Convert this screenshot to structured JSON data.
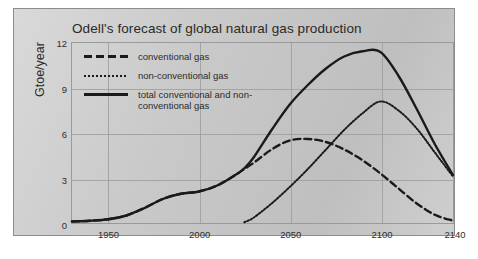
{
  "chart_data": {
    "type": "line",
    "title": "Odell's forecast of global natural gas production",
    "xlabel": "",
    "ylabel": "Gtoe/year",
    "xlim": [
      1930,
      2140
    ],
    "ylim": [
      0,
      12
    ],
    "xticks": [
      "1950",
      "2000",
      "2050",
      "2100",
      "2140"
    ],
    "xtick_values": [
      1950,
      2000,
      2050,
      2100,
      2140
    ],
    "yticks": [
      "0",
      "3",
      "6",
      "9",
      "12"
    ],
    "ytick_values": [
      0,
      3,
      6,
      9,
      12
    ],
    "grid": true,
    "legend_position": "top-left",
    "x": [
      1930,
      1940,
      1950,
      1960,
      1970,
      1980,
      1990,
      2000,
      2010,
      2020,
      2025,
      2030,
      2040,
      2050,
      2060,
      2070,
      2080,
      2090,
      2100,
      2110,
      2120,
      2130,
      2140
    ],
    "series": [
      {
        "name": "conventional gas",
        "style": "dashed",
        "color": "#1a1a1a",
        "values": [
          0.1,
          0.15,
          0.25,
          0.5,
          1.0,
          1.6,
          1.95,
          2.1,
          2.5,
          3.2,
          3.6,
          4.0,
          4.9,
          5.5,
          5.6,
          5.4,
          4.9,
          4.2,
          3.3,
          2.3,
          1.3,
          0.55,
          0.15
        ]
      },
      {
        "name": "non-conventional gas",
        "style": "dotted",
        "color": "#1a1a1a",
        "values": [
          0,
          0,
          0,
          0,
          0,
          0,
          0,
          0,
          0,
          0,
          0.05,
          0.35,
          1.3,
          2.4,
          3.6,
          4.9,
          6.2,
          7.3,
          8.1,
          7.5,
          6.3,
          4.7,
          3.1
        ]
      },
      {
        "name": "total conventional and non-conventional gas",
        "style": "solid",
        "color": "#1a1a1a",
        "values": [
          0.1,
          0.15,
          0.25,
          0.5,
          1.0,
          1.6,
          1.95,
          2.1,
          2.5,
          3.2,
          3.65,
          4.35,
          6.2,
          7.9,
          9.2,
          10.3,
          11.1,
          11.45,
          11.4,
          9.8,
          7.6,
          5.25,
          3.2
        ]
      }
    ]
  },
  "legend": {
    "entries": [
      {
        "label": "conventional gas",
        "style": "dashed"
      },
      {
        "label": "non-conventional gas",
        "style": "dotted"
      },
      {
        "label": "total conventional and non-\nconventional gas",
        "style": "solid"
      }
    ]
  },
  "colors": {
    "paper": "#c9c9c9",
    "frame": "#8c8c8c",
    "grid": "#9e9e9e",
    "ink": "#1a1a1a"
  }
}
